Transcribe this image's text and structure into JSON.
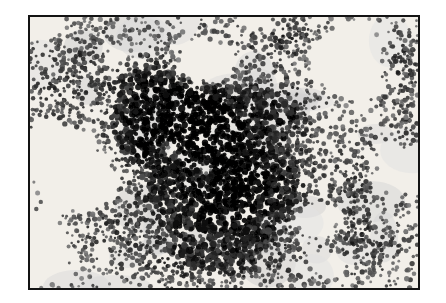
{
  "page": {
    "background": "#ffffff"
  },
  "figure": {
    "alt": "Black-and-white photomicrograph of a stained cell smear: a large dense, dark cluster of overlapping cells occupies the center, surrounded by loosely scattered dark cells and clear white spaces, enclosed in a thin black frame",
    "frame": {
      "border_color": "#131313",
      "border_width": 2,
      "background": "#f2efe9"
    },
    "render": {
      "width": 388,
      "height": 271,
      "seed": 42,
      "candidates": 9500,
      "base_density": 0.5,
      "accept_cap": 3.0,
      "cell_opacity": 0.9,
      "wash_color_min": 205,
      "wash_color_max": 228,
      "clusters": [
        {
          "cx": 160,
          "cy": 85,
          "rx": 58,
          "ry": 46,
          "amp": 5.0
        },
        {
          "cx": 118,
          "cy": 112,
          "rx": 34,
          "ry": 36,
          "amp": 3.2
        },
        {
          "cx": 205,
          "cy": 178,
          "rx": 72,
          "ry": 52,
          "amp": 5.0
        },
        {
          "cx": 178,
          "cy": 128,
          "rx": 46,
          "ry": 36,
          "amp": 3.6
        },
        {
          "cx": 252,
          "cy": 22,
          "rx": 48,
          "ry": 20,
          "amp": 2.0
        },
        {
          "cx": 300,
          "cy": 55,
          "rx": 26,
          "ry": 26,
          "amp": 1.6
        },
        {
          "cx": 368,
          "cy": 42,
          "rx": 26,
          "ry": 38,
          "amp": 1.9
        },
        {
          "cx": 62,
          "cy": 48,
          "rx": 52,
          "ry": 38,
          "amp": 1.4
        },
        {
          "cx": 85,
          "cy": 195,
          "rx": 55,
          "ry": 42,
          "amp": 1.3
        },
        {
          "cx": 172,
          "cy": 243,
          "rx": 75,
          "ry": 24,
          "amp": 1.7
        },
        {
          "cx": 327,
          "cy": 173,
          "rx": 20,
          "ry": 46,
          "amp": 1.5
        },
        {
          "cx": 330,
          "cy": 232,
          "rx": 48,
          "ry": 30,
          "amp": 1.3
        },
        {
          "cx": 378,
          "cy": 120,
          "rx": 22,
          "ry": 30,
          "amp": 1.1
        },
        {
          "cx": 25,
          "cy": 90,
          "rx": 25,
          "ry": 35,
          "amp": 1.2
        },
        {
          "cx": 255,
          "cy": 95,
          "rx": 30,
          "ry": 30,
          "amp": 2.2
        }
      ],
      "voids": [
        {
          "cx": 175,
          "cy": 50,
          "rx": 28,
          "ry": 20,
          "amp": 6.0
        },
        {
          "cx": 28,
          "cy": 138,
          "rx": 26,
          "ry": 22,
          "amp": 4.0
        },
        {
          "cx": 60,
          "cy": 168,
          "rx": 30,
          "ry": 20,
          "amp": 4.0
        },
        {
          "cx": 140,
          "cy": 133,
          "rx": 9,
          "ry": 8,
          "amp": 7.0
        },
        {
          "cx": 176,
          "cy": 152,
          "rx": 10,
          "ry": 9,
          "amp": 7.0
        },
        {
          "cx": 318,
          "cy": 45,
          "rx": 33,
          "ry": 27,
          "amp": 5.0
        },
        {
          "cx": 368,
          "cy": 148,
          "rx": 16,
          "ry": 17,
          "amp": 4.0
        },
        {
          "cx": 285,
          "cy": 203,
          "rx": 20,
          "ry": 15,
          "amp": 4.5
        },
        {
          "cx": 8,
          "cy": 228,
          "rx": 24,
          "ry": 26,
          "amp": 3.5
        },
        {
          "cx": 8,
          "cy": 8,
          "rx": 20,
          "ry": 13,
          "amp": 2.5
        },
        {
          "cx": 298,
          "cy": 247,
          "rx": 17,
          "ry": 11,
          "amp": 3.5
        },
        {
          "cx": 230,
          "cy": 8,
          "rx": 20,
          "ry": 10,
          "amp": 2.0
        },
        {
          "cx": 90,
          "cy": 38,
          "rx": 15,
          "ry": 13,
          "amp": 2.0
        }
      ]
    }
  }
}
